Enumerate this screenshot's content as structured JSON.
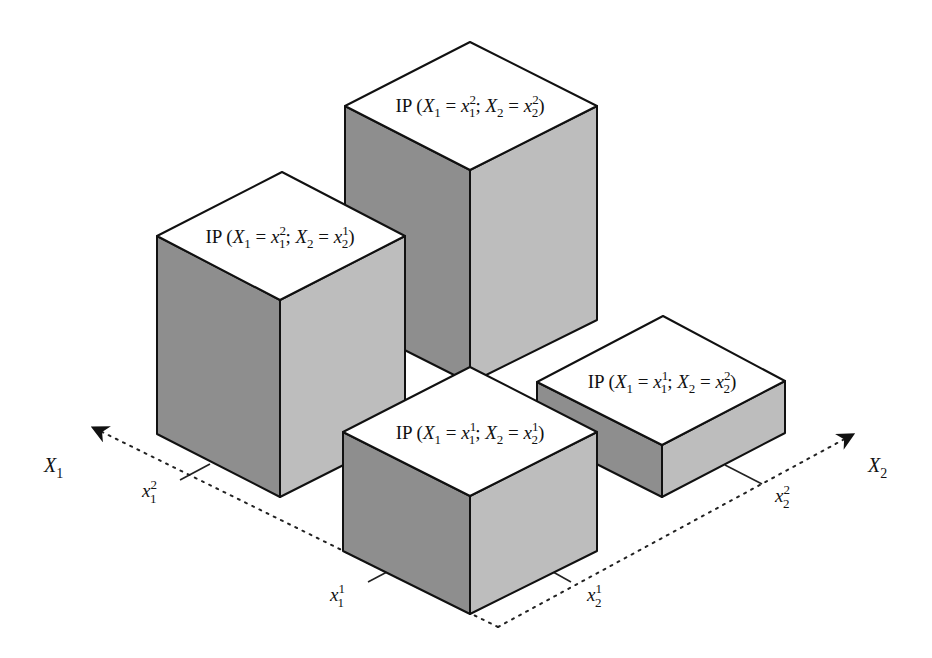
{
  "diagram": {
    "type": "3d-bar-joint-probability",
    "axes": {
      "x1": {
        "label": "X",
        "sub": "1",
        "ticks": [
          {
            "base": "x",
            "sub": "1",
            "sup": "1"
          },
          {
            "base": "x",
            "sub": "1",
            "sup": "2"
          }
        ]
      },
      "x2": {
        "label": "X",
        "sub": "2",
        "ticks": [
          {
            "base": "x",
            "sub": "2",
            "sup": "1"
          },
          {
            "base": "x",
            "sub": "2",
            "sup": "2"
          }
        ]
      }
    },
    "bars": [
      {
        "id": "x1_2_x2_2",
        "label_prefix": "IP (",
        "v1": "X",
        "s1": "1",
        "eq": " = ",
        "a": "x",
        "as": "1",
        "ap": "2",
        "sep": "; ",
        "v2": "X",
        "s2": "2",
        "b": "x",
        "bs": "2",
        "bp": "2",
        "close": ")",
        "relative_height": "tallest"
      },
      {
        "id": "x1_2_x2_1",
        "label_prefix": "IP (",
        "v1": "X",
        "s1": "1",
        "eq": " = ",
        "a": "x",
        "as": "1",
        "ap": "2",
        "sep": "; ",
        "v2": "X",
        "s2": "2",
        "b": "x",
        "bs": "2",
        "bp": "1",
        "close": ")",
        "relative_height": "tall"
      },
      {
        "id": "x1_1_x2_2",
        "label_prefix": "IP (",
        "v1": "X",
        "s1": "1",
        "eq": " = ",
        "a": "x",
        "as": "1",
        "ap": "1",
        "sep": "; ",
        "v2": "X",
        "s2": "2",
        "b": "x",
        "bs": "2",
        "bp": "2",
        "close": ")",
        "relative_height": "shortest"
      },
      {
        "id": "x1_1_x2_1",
        "label_prefix": "IP (",
        "v1": "X",
        "s1": "1",
        "eq": " = ",
        "a": "x",
        "as": "1",
        "ap": "1",
        "sep": "; ",
        "v2": "X",
        "s2": "2",
        "b": "x",
        "bs": "2",
        "bp": "1",
        "close": ")",
        "relative_height": "medium-short"
      }
    ],
    "colors": {
      "top": "#ffffff",
      "left_face": "#8e8e8e",
      "right_face": "#bdbdbd",
      "outline": "#111111"
    }
  }
}
